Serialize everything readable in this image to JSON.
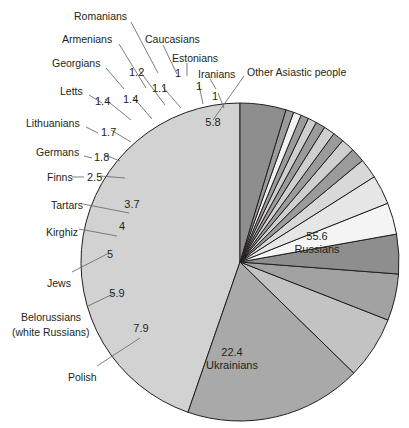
{
  "chart_data": {
    "type": "pie",
    "title": "",
    "units": "percent",
    "total": 100,
    "center": {
      "x": 240,
      "y": 262
    },
    "radius": 159,
    "start_angle_deg": -90,
    "direction": "counterclockwise",
    "legend": "none",
    "grid": false,
    "categories": [
      "Russians",
      "Ukrainians",
      "Polish",
      "Belorussians (white Russians)",
      "Jews",
      "Kirghiz",
      "Tartars",
      "Finns",
      "Germans",
      "Lithuanians",
      "Letts",
      "Georgians",
      "Armenians",
      "Romanians",
      "Caucasians",
      "Estonians",
      "Iranians",
      "Other Asiastic people"
    ],
    "values": [
      55.6,
      22.4,
      7.9,
      5.9,
      5,
      4,
      3.7,
      2.5,
      1.8,
      1.7,
      1.4,
      1.4,
      1.2,
      1.1,
      1,
      1,
      1,
      5.8
    ],
    "value_labels": [
      "55.6",
      "22.4",
      "7.9",
      "5.9",
      "5",
      "4",
      "3.7",
      "2.5",
      "1.8",
      "1.7",
      "1.4",
      "1.4",
      "1.2",
      "1.1",
      "1",
      "1",
      "1",
      "5.8"
    ],
    "colors": [
      "#d2d2d2",
      "#a9a9a9",
      "#c3c3c3",
      "#a2a2a2",
      "#8e8e8e",
      "#f4f4f4",
      "#e6e6e6",
      "#d8d8d8",
      "#9b9b9b",
      "#cfcfcf",
      "#9b9b9b",
      "#cfcfcf",
      "#9b9b9b",
      "#cfcfcf",
      "#9b9b9b",
      "#f2f2f2",
      "#9b9b9b",
      "#8e8e8e"
    ],
    "stroke_color": "#231f20",
    "stroke_width": 1
  },
  "inside_labels": [
    {
      "name": "russians",
      "value": "55.6",
      "label": "Russians",
      "x": 317,
      "y": 240
    },
    {
      "name": "ukrainians",
      "value": "22.4",
      "label": "Ukrainians",
      "x": 232,
      "y": 356
    },
    {
      "name": "other-asiastic",
      "value": "5.8",
      "label": "",
      "x": 213,
      "y": 126
    },
    {
      "name": "polish",
      "value": "7.9",
      "label": "",
      "x": 141,
      "y": 332
    },
    {
      "name": "belorussians",
      "value": "5.9",
      "label": "",
      "x": 117,
      "y": 297
    },
    {
      "name": "jews",
      "value": "5",
      "label": "",
      "x": 110,
      "y": 258
    },
    {
      "name": "kirghiz",
      "value": "4",
      "label": "",
      "x": 122,
      "y": 230
    },
    {
      "name": "tartars",
      "value": "3.7",
      "label": "",
      "x": 132,
      "y": 208
    }
  ],
  "outside_labels": [
    {
      "name": "romanians",
      "text": "Romanians",
      "x": 74,
      "y": 10,
      "align": "left"
    },
    {
      "name": "armenians",
      "text": "Armenians",
      "x": 62,
      "y": 33,
      "align": "left"
    },
    {
      "name": "caucasians",
      "text": "Caucasians",
      "x": 145,
      "y": 33,
      "align": "left"
    },
    {
      "name": "estonians",
      "text": "Estonians",
      "x": 172,
      "y": 52,
      "align": "left"
    },
    {
      "name": "georgians",
      "text": "Georgians",
      "x": 52,
      "y": 57,
      "align": "left"
    },
    {
      "name": "iranians",
      "text": "Iranians",
      "x": 198,
      "y": 68,
      "align": "left"
    },
    {
      "name": "other-asiastic-people",
      "text": "Other Asiastic people",
      "x": 247,
      "y": 66,
      "align": "left"
    },
    {
      "name": "letts",
      "text": "Letts",
      "x": 60,
      "y": 85,
      "align": "left"
    },
    {
      "name": "lithuanians",
      "text": "Lithuanians",
      "x": 26,
      "y": 117,
      "align": "left"
    },
    {
      "name": "germans",
      "text": "Germans",
      "x": 36,
      "y": 146,
      "align": "left"
    },
    {
      "name": "finns",
      "text": "Finns",
      "x": 47,
      "y": 171,
      "align": "left"
    },
    {
      "name": "tartars",
      "text": "Tartars",
      "x": 51,
      "y": 199,
      "align": "left"
    },
    {
      "name": "kirghiz",
      "text": "Kirghiz",
      "x": 46,
      "y": 226,
      "align": "left"
    },
    {
      "name": "jews",
      "text": "Jews",
      "x": 47,
      "y": 277,
      "align": "left"
    },
    {
      "name": "belorussians",
      "text": "Belorussians",
      "x": 21,
      "y": 311,
      "align": "left"
    },
    {
      "name": "belorussians-sub",
      "text": "(white Russians)",
      "x": 12,
      "y": 326,
      "align": "left"
    },
    {
      "name": "polish",
      "text": "Polish",
      "x": 68,
      "y": 371,
      "align": "left"
    }
  ],
  "outside_numbers": [
    {
      "name": "num-1-2",
      "text": "1.2",
      "x": 129,
      "y": 66
    },
    {
      "name": "num-1",
      "text": "1",
      "x": 175,
      "y": 67
    },
    {
      "name": "num-1-1",
      "text": "1.1",
      "x": 152,
      "y": 82
    },
    {
      "name": "num-1b",
      "text": "1",
      "x": 196,
      "y": 80
    },
    {
      "name": "num-1c",
      "text": "1",
      "x": 212,
      "y": 90
    },
    {
      "name": "num-1-4a",
      "text": "1.4",
      "x": 95,
      "y": 95
    },
    {
      "name": "num-1-4b",
      "text": "1.4",
      "x": 123,
      "y": 93
    },
    {
      "name": "num-1-7",
      "text": "1.7",
      "x": 101,
      "y": 126
    },
    {
      "name": "num-1-8",
      "text": "1.8",
      "x": 94,
      "y": 151
    },
    {
      "name": "num-2-5",
      "text": "2.5",
      "x": 87,
      "y": 171
    }
  ],
  "leaders": [
    {
      "name": "leader-romanians",
      "x1": 131,
      "y1": 22,
      "x2": 158,
      "y2": 73
    },
    {
      "name": "leader-armenians",
      "x1": 119,
      "y1": 44,
      "x2": 146,
      "y2": 88
    },
    {
      "name": "leader-caucasians",
      "x1": 163,
      "y1": 45,
      "x2": 177,
      "y2": 74
    },
    {
      "name": "leader-estonians",
      "x1": 187,
      "y1": 63,
      "x2": 187,
      "y2": 76
    },
    {
      "name": "leader-georgians",
      "x1": 106,
      "y1": 68,
      "x2": 124,
      "y2": 89
    },
    {
      "name": "leader-iranians",
      "x1": 210,
      "y1": 79,
      "x2": 216,
      "y2": 89
    },
    {
      "name": "leader-other-asiastic",
      "x1": 244,
      "y1": 76,
      "x2": 213,
      "y2": 120
    },
    {
      "name": "leader-letts",
      "x1": 89,
      "y1": 95,
      "x2": 102,
      "y2": 103
    },
    {
      "name": "leader-lithuanians",
      "x1": 86,
      "y1": 127,
      "x2": 98,
      "y2": 133
    },
    {
      "name": "leader-germans",
      "x1": 84,
      "y1": 156,
      "x2": 92,
      "y2": 158
    },
    {
      "name": "leader-finns",
      "x1": 72,
      "y1": 177,
      "x2": 84,
      "y2": 177
    },
    {
      "name": "leader-tartars",
      "x1": 83,
      "y1": 204,
      "x2": 129,
      "y2": 213
    },
    {
      "name": "leader-kirghiz",
      "x1": 79,
      "y1": 229,
      "x2": 117,
      "y2": 236
    },
    {
      "name": "leader-jews",
      "x1": 72,
      "y1": 272,
      "x2": 107,
      "y2": 254
    },
    {
      "name": "leader-belorussians",
      "x1": 88,
      "y1": 306,
      "x2": 115,
      "y2": 293
    },
    {
      "name": "leader-polish",
      "x1": 97,
      "y1": 366,
      "x2": 140,
      "y2": 338
    },
    {
      "name": "leader-1-2",
      "x1": 139,
      "y1": 70,
      "x2": 165,
      "y2": 105
    },
    {
      "name": "leader-1-1",
      "x1": 162,
      "y1": 86,
      "x2": 181,
      "y2": 108
    },
    {
      "name": "leader-1b",
      "x1": 199,
      "y1": 85,
      "x2": 203,
      "y2": 104
    },
    {
      "name": "leader-1c",
      "x1": 218,
      "y1": 93,
      "x2": 224,
      "y2": 108
    },
    {
      "name": "leader-1-4a",
      "x1": 105,
      "y1": 99,
      "x2": 131,
      "y2": 120
    },
    {
      "name": "leader-1-4b",
      "x1": 133,
      "y1": 97,
      "x2": 152,
      "y2": 119
    },
    {
      "name": "leader-1-7",
      "x1": 111,
      "y1": 130,
      "x2": 131,
      "y2": 142
    },
    {
      "name": "leader-1-8",
      "x1": 105,
      "y1": 155,
      "x2": 120,
      "y2": 161
    },
    {
      "name": "leader-2-5",
      "x1": 100,
      "y1": 176,
      "x2": 125,
      "y2": 178
    }
  ]
}
